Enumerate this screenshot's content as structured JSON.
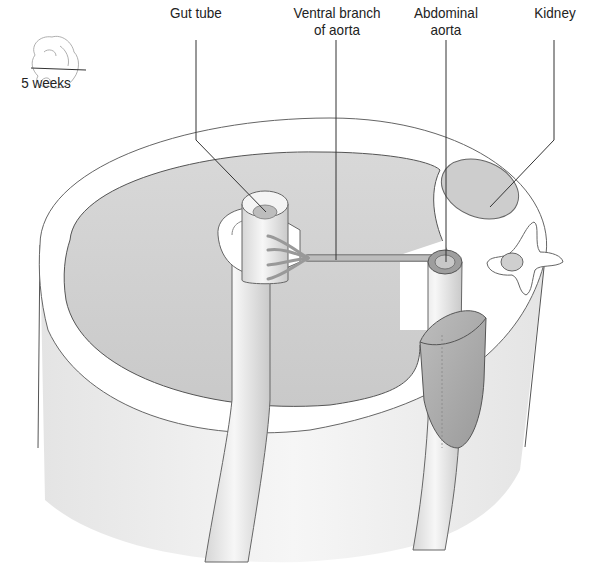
{
  "diagram": {
    "stage_label": "5 weeks",
    "labels": [
      {
        "id": "gut-tube",
        "lines": [
          "Gut tube"
        ]
      },
      {
        "id": "ventral-branch-of-aorta",
        "lines": [
          "Ventral branch",
          "of aorta"
        ]
      },
      {
        "id": "abdominal-aorta",
        "lines": [
          "Abdominal",
          "aorta"
        ]
      },
      {
        "id": "kidney",
        "lines": [
          "Kidney"
        ]
      }
    ],
    "colors": {
      "outline": "#6b6b6b",
      "cavity_fill": "#cfcfcf",
      "wall_fill": "#f2f2f2",
      "organ_fill": "#c4c4c4",
      "leader": "#333333"
    }
  }
}
